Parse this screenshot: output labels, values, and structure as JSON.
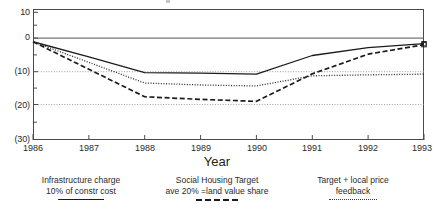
{
  "chart_data": {
    "type": "line",
    "title": "",
    "xlabel": "Year",
    "ylabel": "",
    "x": [
      1986,
      1987,
      1988,
      1989,
      1990,
      1991,
      1992,
      1993
    ],
    "xlim": [
      1986,
      1993
    ],
    "ylim": [
      -30,
      10
    ],
    "yticks": [
      10,
      0,
      -10,
      -20,
      -30
    ],
    "ytick_labels": [
      "10",
      "0",
      "(10)",
      "(20)",
      "(30)"
    ],
    "xtick_labels": [
      "1986",
      "1987",
      "1988",
      "1989",
      "1990",
      "1991",
      "1992",
      "1993"
    ],
    "grid": "horizontal-dotted",
    "legend_position": "below",
    "series": [
      {
        "name": "Infrastructure charge 10% of constr cost",
        "style": "solid",
        "color": "#1c1c1c",
        "values": [
          0,
          -4.6,
          -9.4,
          -9.6,
          -9.9,
          -4.2,
          -1.8,
          -0.6
        ]
      },
      {
        "name": "Social Housing Target ave 20% =land value share",
        "style": "dashed",
        "color": "#1c1c1c",
        "values": [
          0,
          -8.4,
          -16.8,
          -17.6,
          -18.2,
          -9.8,
          -3.8,
          -0.9
        ]
      },
      {
        "name": "Target + local price feedback",
        "style": "dotted",
        "color": "#3a3a3a",
        "values": [
          0,
          -6.3,
          -12.6,
          -13.2,
          -13.5,
          -10.4,
          -10.1,
          -9.9
        ]
      }
    ]
  },
  "axis": {
    "x_title": "Year"
  },
  "legend": {
    "items": [
      {
        "line1": "Infrastructure charge",
        "line2": "10% of constr cost",
        "style": "solid"
      },
      {
        "line1": "Social Housing Target",
        "line2": "ave 20% =land value share",
        "style": "dashed"
      },
      {
        "line1": "Target + local price",
        "line2": "feedback",
        "style": "dotted"
      }
    ]
  }
}
